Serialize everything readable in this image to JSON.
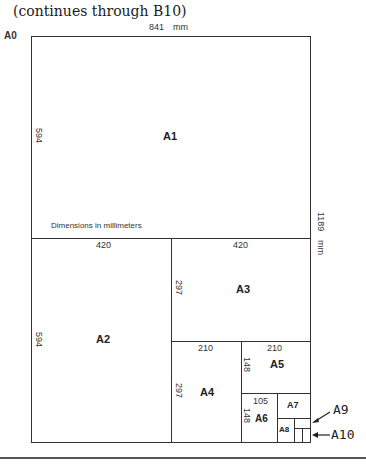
{
  "caption": "(continues through B10)",
  "top_dimension": "841",
  "top_unit": "mm",
  "side_dimension": "1189",
  "side_unit": "mm",
  "note": "Dimensions in millimeters",
  "sheets": {
    "A0": {
      "name": "A0"
    },
    "A1": {
      "name": "A1",
      "width": "841",
      "height": "594"
    },
    "A2": {
      "name": "A2",
      "width": "420",
      "height": "594"
    },
    "A3": {
      "name": "A3",
      "width": "420",
      "height": "297"
    },
    "A4": {
      "name": "A4",
      "width": "210",
      "height": "297"
    },
    "A5": {
      "name": "A5",
      "width": "210",
      "height": "148"
    },
    "A6": {
      "name": "A6",
      "width": "105",
      "height": "148"
    },
    "A7": {
      "name": "A7"
    },
    "A8": {
      "name": "A8"
    },
    "A9": {
      "name": "A9"
    },
    "A10": {
      "name": "A10"
    }
  }
}
